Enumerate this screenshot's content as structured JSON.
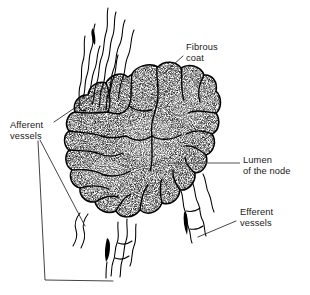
{
  "figure": {
    "background_color": "#ffffff",
    "ink_color": "#000000",
    "text_color": "#1a1a1a",
    "leader_color": "#222222",
    "lumen_leader_color": "#555555",
    "width": 310,
    "height": 295
  },
  "labels": {
    "fibrous_coat": {
      "line1": "Fibrous",
      "line2": "coat",
      "x": 186,
      "y": 50
    },
    "afferent_vessels": {
      "line1": "Afferent",
      "line2": "vessels",
      "x": 10,
      "y": 128
    },
    "lumen": {
      "line1": "Lumen",
      "line2": "of the node",
      "x": 243,
      "y": 163
    },
    "efferent_vessels": {
      "line1": "Efferent",
      "line2": "vessels",
      "x": 240,
      "y": 215
    }
  },
  "structures": {
    "node": "lobulated lymph node body with stippled cortex and fibrous septa",
    "afferent_group_top": "bundle of wavy afferent lymphatic vessels entering at upper left",
    "afferent_group_bottom": "wavy afferent lymphatic vessels entering at lower left",
    "efferent_group": "wavy efferent lymphatic vessels leaving at lower right",
    "flow_arrows": 3
  }
}
